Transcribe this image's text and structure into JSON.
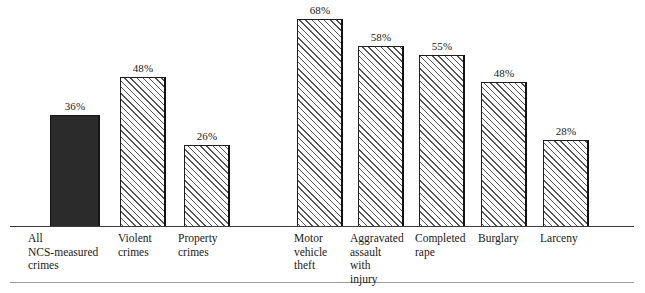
{
  "chart_data": {
    "type": "bar",
    "title": "",
    "subtitle": "",
    "xlabel": "",
    "ylabel": "",
    "ylim": [
      0,
      73
    ],
    "grid": false,
    "legend": null,
    "value_suffix": "%",
    "categories": [
      "All\nNCS-measured\ncrimes",
      "Violent\ncrimes",
      "Property\ncrimes",
      "Motor\nvehicle\ntheft",
      "Aggravated\nassault\nwith\ninjury",
      "Completed\nrape",
      "Burglary",
      "Larceny"
    ],
    "values": [
      36,
      48,
      26,
      68,
      58,
      55,
      48,
      28
    ],
    "value_labels": [
      "36%",
      "48%",
      "26%",
      "68%",
      "58%",
      "55%",
      "48%",
      "28%"
    ],
    "bar_styles": [
      "solid",
      "hatched",
      "hatched",
      "hatched",
      "hatched",
      "hatched",
      "hatched",
      "hatched"
    ],
    "groups": [
      {
        "name": "overall-and-broad-categories",
        "category_indices": [
          0,
          1,
          2
        ]
      },
      {
        "name": "specific-crime-types",
        "category_indices": [
          3,
          4,
          5,
          6,
          7
        ]
      }
    ],
    "colors": {
      "solid_bar": "#2b2b2b",
      "hatch_line": "#555555",
      "bar_outline": "#1e1e1e",
      "background": "#ffffff",
      "baseline": "#3d3d3d",
      "bottom_rule": "#9a9a9a"
    }
  },
  "bars": [
    {
      "label": "All\nNCS-measured\ncrimes",
      "value_label": "36%",
      "style": "solid",
      "left": 50,
      "width": 50,
      "top": 115,
      "label_left": 28,
      "label_width": 100,
      "value_left": 40,
      "value_width": 70
    },
    {
      "label": "Violent\ncrimes",
      "value_label": "48%",
      "style": "hatched",
      "left": 120,
      "width": 46,
      "top": 77,
      "label_left": 118,
      "label_width": 70,
      "value_left": 108,
      "value_width": 70
    },
    {
      "label": "Property\ncrimes",
      "value_label": "26%",
      "style": "hatched",
      "left": 184,
      "width": 46,
      "top": 145,
      "label_left": 178,
      "label_width": 80,
      "value_left": 172,
      "value_width": 70
    },
    {
      "label": "Motor\nvehicle\ntheft",
      "value_label": "68%",
      "style": "hatched",
      "left": 297,
      "width": 46,
      "top": 19,
      "label_left": 294,
      "label_width": 70,
      "value_left": 285,
      "value_width": 70
    },
    {
      "label": "Aggravated\nassault\nwith\ninjury",
      "value_label": "58%",
      "style": "hatched",
      "left": 358,
      "width": 46,
      "top": 46,
      "label_left": 350,
      "label_width": 84,
      "value_left": 346,
      "value_width": 70
    },
    {
      "label": "Completed\nrape",
      "value_label": "55%",
      "style": "hatched",
      "left": 419,
      "width": 46,
      "top": 55,
      "label_left": 415,
      "label_width": 80,
      "value_left": 407,
      "value_width": 70
    },
    {
      "label": "Burglary",
      "value_label": "48%",
      "style": "hatched",
      "left": 481,
      "width": 46,
      "top": 82,
      "label_left": 478,
      "label_width": 70,
      "value_left": 469,
      "value_width": 70
    },
    {
      "label": "Larceny",
      "value_label": "28%",
      "style": "hatched",
      "left": 543,
      "width": 46,
      "top": 140,
      "label_left": 540,
      "label_width": 70,
      "value_left": 531,
      "value_width": 70
    }
  ]
}
